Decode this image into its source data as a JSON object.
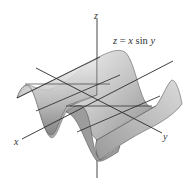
{
  "figure": {
    "equation": {
      "lhs": "z",
      "eq": " = ",
      "x": "x",
      "fn": " sin ",
      "y": "y"
    },
    "axes": {
      "x_label": "x",
      "y_label": "y",
      "z_label": "z"
    },
    "colors": {
      "surface_light": "#e6e6e6",
      "surface_mid": "#bdbdbd",
      "surface_dark": "#8a8a8a",
      "line": "#2a2a2a"
    }
  }
}
